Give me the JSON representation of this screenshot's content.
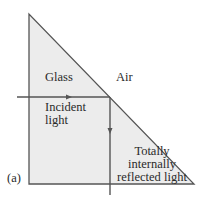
{
  "figure": {
    "panel_label": "(a)",
    "labels": {
      "glass": "Glass",
      "air": "Air",
      "incident_line1": "Incident",
      "incident_line2": "light",
      "reflected_line1": "Totally",
      "reflected_line2": "internally",
      "reflected_line3": "reflected light"
    },
    "colors": {
      "prism_fill": "#ececec",
      "stroke": "#555555",
      "text": "#2a2a2a"
    }
  }
}
